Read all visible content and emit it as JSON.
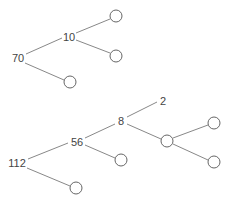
{
  "diagram": {
    "type": "binary-tree-factor-diagrams",
    "trees": [
      {
        "id": "tree-1",
        "nodes": [
          {
            "id": "t1-root",
            "label": "70",
            "kind": "value",
            "x": 18,
            "y": 58
          },
          {
            "id": "t1-n10",
            "label": "10",
            "kind": "value",
            "x": 69,
            "y": 37
          },
          {
            "id": "t1-l1",
            "label": "",
            "kind": "blank",
            "x": 116,
            "y": 16
          },
          {
            "id": "t1-l2",
            "label": "",
            "kind": "blank",
            "x": 116,
            "y": 56
          },
          {
            "id": "t1-l3",
            "label": "",
            "kind": "blank",
            "x": 70,
            "y": 82
          }
        ],
        "edges": [
          [
            "t1-root",
            "t1-n10"
          ],
          [
            "t1-root",
            "t1-l3"
          ],
          [
            "t1-n10",
            "t1-l1"
          ],
          [
            "t1-n10",
            "t1-l2"
          ]
        ]
      },
      {
        "id": "tree-2",
        "nodes": [
          {
            "id": "t2-root",
            "label": "112",
            "kind": "value",
            "x": 17,
            "y": 163
          },
          {
            "id": "t2-n56",
            "label": "56",
            "kind": "value",
            "x": 77,
            "y": 142
          },
          {
            "id": "t2-n8",
            "label": "8",
            "kind": "value",
            "x": 121,
            "y": 121
          },
          {
            "id": "t2-n2",
            "label": "2",
            "kind": "value",
            "x": 163,
            "y": 101
          },
          {
            "id": "t2-b1",
            "label": "",
            "kind": "blank",
            "x": 167,
            "y": 141
          },
          {
            "id": "t2-b2",
            "label": "",
            "kind": "blank",
            "x": 214,
            "y": 123
          },
          {
            "id": "t2-b3",
            "label": "",
            "kind": "blank",
            "x": 214,
            "y": 162
          },
          {
            "id": "t2-b4",
            "label": "",
            "kind": "blank",
            "x": 121,
            "y": 160
          },
          {
            "id": "t2-b5",
            "label": "",
            "kind": "blank",
            "x": 76,
            "y": 188
          }
        ],
        "edges": [
          [
            "t2-root",
            "t2-n56"
          ],
          [
            "t2-root",
            "t2-b5"
          ],
          [
            "t2-n56",
            "t2-n8"
          ],
          [
            "t2-n56",
            "t2-b4"
          ],
          [
            "t2-n8",
            "t2-n2"
          ],
          [
            "t2-n8",
            "t2-b1"
          ],
          [
            "t2-b1",
            "t2-b2"
          ],
          [
            "t2-b1",
            "t2-b3"
          ]
        ]
      }
    ]
  },
  "labels": {
    "t1_root": "70",
    "t1_n10": "10",
    "t2_root": "112",
    "t2_n56": "56",
    "t2_n8": "8",
    "t2_n2": "2"
  }
}
